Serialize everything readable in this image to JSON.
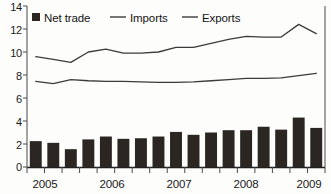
{
  "chart_data": {
    "type": "bar",
    "title": "",
    "subtitle": "",
    "xlabel": "",
    "ylabel": "",
    "ylim": [
      0,
      14
    ],
    "yticks": [
      0,
      2,
      4,
      6,
      8,
      10,
      12,
      14
    ],
    "ytick_labels": [
      "0",
      "2",
      "4",
      "6",
      "8",
      "10",
      "12",
      "14"
    ],
    "grid": false,
    "legend_position": "top-left-inside",
    "x": [
      "2005 Q1",
      "2005 Q2",
      "2005 Q3",
      "2005 Q4",
      "2006 Q1",
      "2006 Q2",
      "2006 Q3",
      "2006 Q4",
      "2007 Q1",
      "2007 Q2",
      "2007 Q3",
      "2007 Q4",
      "2008 Q1",
      "2008 Q2",
      "2008 Q3",
      "2008 Q4",
      "2009 Q1"
    ],
    "categories": [
      "2005 Q1",
      "2005 Q2",
      "2005 Q3",
      "2005 Q4",
      "2006 Q1",
      "2006 Q2",
      "2006 Q3",
      "2006 Q4",
      "2007 Q1",
      "2007 Q2",
      "2007 Q3",
      "2007 Q4",
      "2008 Q1",
      "2008 Q2",
      "2008 Q3",
      "2008 Q4",
      "2009 Q1"
    ],
    "xtick_labels": [
      "2005",
      "2006",
      "2007",
      "2008",
      "2009"
    ],
    "xtick_label_positions": [
      0,
      4,
      8,
      12,
      16
    ],
    "series": [
      {
        "name": "Net trade",
        "type": "bar",
        "color": "#2b2622",
        "values": [
          2.25,
          2.1,
          1.55,
          2.4,
          2.65,
          2.45,
          2.5,
          2.65,
          3.05,
          2.8,
          3.0,
          3.2,
          3.2,
          3.5,
          3.25,
          4.3,
          3.4
        ]
      },
      {
        "name": "Imports",
        "type": "line",
        "color": "#3b3b3b",
        "values": [
          9.6,
          9.35,
          9.1,
          10.0,
          10.25,
          9.9,
          9.9,
          10.0,
          10.4,
          10.4,
          10.75,
          11.1,
          11.35,
          11.3,
          11.3,
          12.4,
          11.6
        ]
      },
      {
        "name": "Exports",
        "type": "line",
        "color": "#3b3b3b",
        "values": [
          7.45,
          7.25,
          7.6,
          7.5,
          7.45,
          7.45,
          7.4,
          7.35,
          7.35,
          7.4,
          7.5,
          7.6,
          7.7,
          7.7,
          7.75,
          7.95,
          8.15
        ]
      }
    ]
  },
  "legend": {
    "items": [
      {
        "label": "Net trade",
        "marker": "square-marker",
        "color": "#2b2622"
      },
      {
        "label": "Imports",
        "marker": "line-marker",
        "color": "#3b3b3b"
      },
      {
        "label": "Exports",
        "marker": "line-marker",
        "color": "#3b3b3b"
      }
    ]
  },
  "axes": {
    "y": {
      "labels": [
        "14",
        "12",
        "10",
        "8",
        "6",
        "4",
        "2",
        "0"
      ]
    },
    "x": {
      "labels": [
        "2005",
        "2006",
        "2007",
        "2008",
        "2009"
      ]
    }
  }
}
